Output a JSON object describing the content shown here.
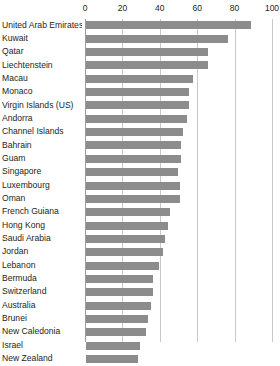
{
  "chart_data": {
    "type": "bar",
    "orientation": "horizontal",
    "title": "",
    "subtitle": "",
    "xlabel": "",
    "ylabel": "",
    "xlim": [
      0,
      100
    ],
    "xticks": [
      0,
      20,
      40,
      60,
      80,
      100
    ],
    "grid": "vertical",
    "legend": "none",
    "bar_color": "#8c8c8c",
    "gridline_color": "#c9c9c9",
    "text_color": "#231f20",
    "note": "chart is cropped at the bottom; New Zealand is the last visible row",
    "categories": [
      "United Arab Emirates",
      "Kuwait",
      "Qatar",
      "Liechtenstein",
      "Macau",
      "Monaco",
      "Virgin Islands (US)",
      "Andorra",
      "Channel Islands",
      "Bahrain",
      "Guam",
      "Singapore",
      "Luxembourg",
      "Oman",
      "French Guiana",
      "Hong Kong",
      "Saudi Arabia",
      "Jordan",
      "Lebanon",
      "Bermuda",
      "Switzerland",
      "Australia",
      "Brunei",
      "New Caledonia",
      "Israel",
      "New Zealand"
    ],
    "values": [
      88,
      76,
      65,
      65,
      57,
      55,
      55,
      54,
      52,
      51,
      51,
      49,
      50,
      50,
      45,
      44,
      42,
      41,
      39,
      36,
      36,
      35,
      33,
      32,
      29,
      28
    ]
  }
}
